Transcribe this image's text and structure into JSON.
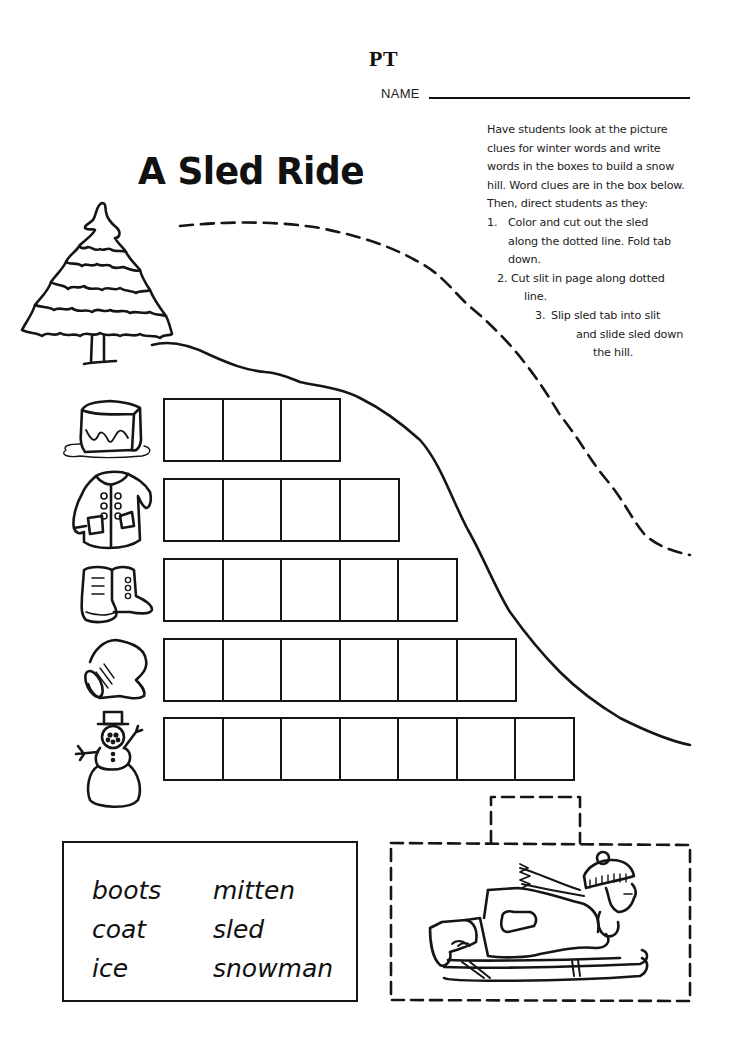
{
  "header": {
    "code": "PT",
    "name_label": "NAME",
    "name_value": ""
  },
  "title": "A Sled Ride",
  "instructions": {
    "intro_lines": [
      "Have students look at the picture",
      "clues for winter words and write",
      "words in the boxes to build a snow",
      "hill. Word clues are in the box below.",
      "Then, direct students as they:"
    ],
    "steps": [
      {
        "number": "1.",
        "lines": [
          "Color and cut out the sled",
          "along the dotted line. Fold tab",
          "down."
        ]
      },
      {
        "number": "2.",
        "lines": [
          "Cut slit in page along dotted",
          "line."
        ]
      },
      {
        "number": "3.",
        "lines": [
          "Slip sled tab into slit",
          "and slide sled down",
          "the hill."
        ]
      }
    ]
  },
  "puzzle_rows": [
    {
      "clue_icon": "ice-cube-icon",
      "answer_length": 3,
      "letters": [
        "",
        "",
        ""
      ]
    },
    {
      "clue_icon": "coat-icon",
      "answer_length": 4,
      "letters": [
        "",
        "",
        "",
        ""
      ]
    },
    {
      "clue_icon": "boots-icon",
      "answer_length": 5,
      "letters": [
        "",
        "",
        "",
        "",
        ""
      ]
    },
    {
      "clue_icon": "mitten-icon",
      "answer_length": 6,
      "letters": [
        "",
        "",
        "",
        "",
        "",
        ""
      ]
    },
    {
      "clue_icon": "snowman-icon",
      "answer_length": 7,
      "letters": [
        "",
        "",
        "",
        "",
        "",
        "",
        ""
      ]
    }
  ],
  "word_bank": {
    "column_1": [
      "boots",
      "coat",
      "ice"
    ],
    "column_2": [
      "mitten",
      "sled",
      "snowman"
    ]
  },
  "cutout": {
    "tab_label": "",
    "picture": "child-on-sled-icon"
  },
  "decor": {
    "tree": "pine-tree-icon",
    "hill": "hill-outline",
    "slit": "dashed-slit-line"
  }
}
